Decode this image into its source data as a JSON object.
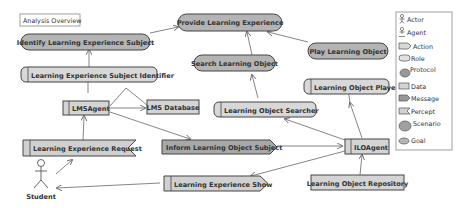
{
  "diagram": {
    "title": "Analysis Overview",
    "nodes": {
      "provide_learning_experience": "Provide Learning Experience",
      "identify_subject": "Identify Learning Experience Subject",
      "search_learning_object": "Search Learning Object",
      "play_learning_object": "Play Learning Object",
      "subject_identifier_role": "Learning Experience Subject Identifier",
      "searcher_role": "Learning Object Searcher",
      "player_role": "Learning Object Player",
      "lms_agent": "LMSAgent",
      "lms_database": "LMS Database",
      "ilo_agent": "ILOAgent",
      "request_percept": "Learning Experience Request",
      "inform_message": "Inform Learning Object Subject",
      "show_action": "Learning Experience Show",
      "repository_data": "Learning Object Repository",
      "student_actor": "Student"
    }
  },
  "legend": {
    "items": [
      {
        "label": "Actor",
        "icon": "actor-icon"
      },
      {
        "label": "Agent",
        "icon": "agent-icon"
      },
      {
        "label": "Action",
        "icon": "action-icon"
      },
      {
        "label": "Role",
        "icon": "role-icon"
      },
      {
        "label": "Protocol",
        "icon": "protocol-icon"
      },
      {
        "label": "Data",
        "icon": "data-icon"
      },
      {
        "label": "Message",
        "icon": "message-icon"
      },
      {
        "label": "Percept",
        "icon": "percept-icon"
      },
      {
        "label": "Scenario",
        "icon": "scenario-icon"
      },
      {
        "label": "Goal",
        "icon": "goal-icon"
      }
    ]
  },
  "colors": {
    "goal_fill": "#b4b4b4",
    "role_fill": "#d8d8d8",
    "data_fill": "#d4d4d4",
    "message_fill": "#a8a8a8",
    "action_fill": "#d0d0d0",
    "stroke": "#444444",
    "line": "#666666"
  }
}
